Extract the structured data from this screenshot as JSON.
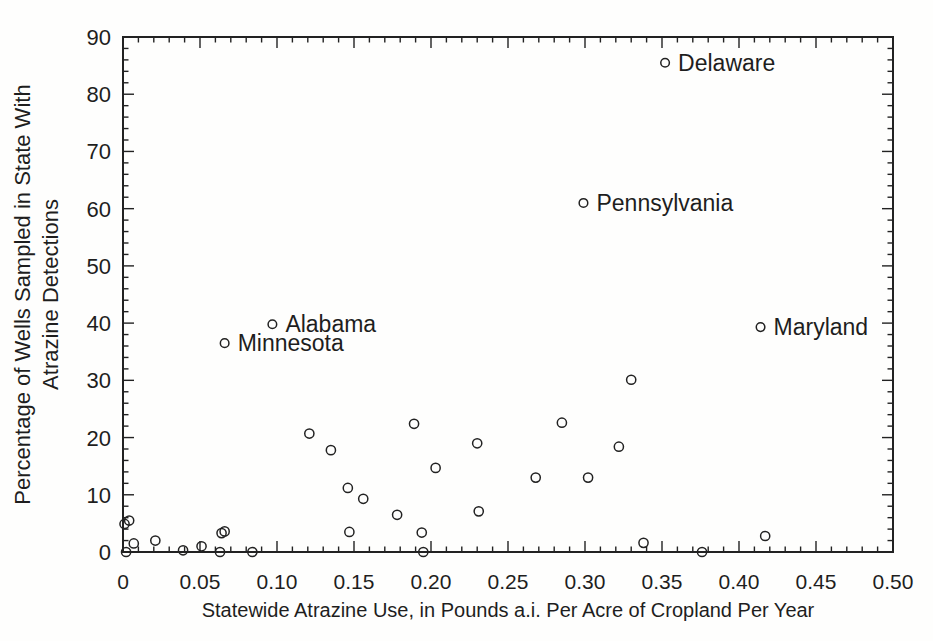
{
  "figure": {
    "colors": {
      "ink": "#222222",
      "background": "#fefefd"
    }
  },
  "chart_data": {
    "type": "scatter",
    "title": "",
    "xlabel": "Statewide Atrazine Use, in Pounds a.i. Per Acre of Cropland Per Year",
    "ylabel_line1": "Percentage of Wells Sampled in State With",
    "ylabel_line2": "Atrazine Detections",
    "xlim": [
      0,
      0.5
    ],
    "ylim": [
      0,
      90
    ],
    "x_major_tick_step": 0.05,
    "x_minor_tick_step": 0.01,
    "y_major_tick_step": 10,
    "y_minor_tick_step": 2,
    "x_tick_labels": [
      "0",
      "0.05",
      "0.10",
      "0.15",
      "0.20",
      "0.25",
      "0.30",
      "0.35",
      "0.40",
      "0.45",
      "0.50"
    ],
    "y_tick_labels": [
      "0",
      "10",
      "20",
      "30",
      "40",
      "50",
      "60",
      "70",
      "80",
      "90"
    ],
    "grid": false,
    "legend": "none",
    "marker": "open-circle",
    "labeled_points": [
      {
        "label": "Delaware",
        "x": 0.352,
        "y": 85.5
      },
      {
        "label": "Pennsylvania",
        "x": 0.299,
        "y": 61.0
      },
      {
        "label": "Maryland",
        "x": 0.414,
        "y": 39.3
      },
      {
        "label": "Alabama",
        "x": 0.097,
        "y": 39.8
      },
      {
        "label": "Minnesota",
        "x": 0.066,
        "y": 36.5
      }
    ],
    "unlabeled_points": [
      [
        0.001,
        4.9
      ],
      [
        0.004,
        5.5
      ],
      [
        0.002,
        0.0
      ],
      [
        0.007,
        1.5
      ],
      [
        0.021,
        2.0
      ],
      [
        0.039,
        0.3
      ],
      [
        0.051,
        1.0
      ],
      [
        0.063,
        0.0
      ],
      [
        0.064,
        3.3
      ],
      [
        0.066,
        3.6
      ],
      [
        0.084,
        0.0
      ],
      [
        0.121,
        20.7
      ],
      [
        0.135,
        17.8
      ],
      [
        0.146,
        11.2
      ],
      [
        0.147,
        3.5
      ],
      [
        0.156,
        9.3
      ],
      [
        0.178,
        6.5
      ],
      [
        0.189,
        22.4
      ],
      [
        0.194,
        3.4
      ],
      [
        0.195,
        0.0
      ],
      [
        0.203,
        14.7
      ],
      [
        0.23,
        19.0
      ],
      [
        0.231,
        7.1
      ],
      [
        0.268,
        13.0
      ],
      [
        0.285,
        22.6
      ],
      [
        0.302,
        13.0
      ],
      [
        0.322,
        18.4
      ],
      [
        0.33,
        30.1
      ],
      [
        0.338,
        1.6
      ],
      [
        0.376,
        0.0
      ],
      [
        0.417,
        2.8
      ]
    ]
  }
}
